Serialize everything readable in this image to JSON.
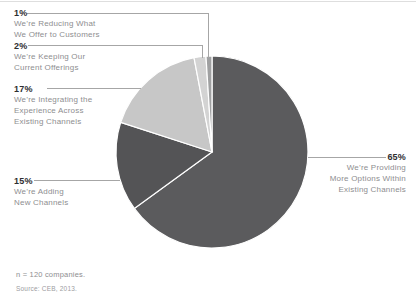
{
  "chart_data": {
    "type": "pie",
    "unit": "%",
    "start_angle_deg": 0,
    "direction": "clockwise",
    "slices": [
      {
        "label": "We’re Providing More Options Within Existing Channels",
        "pct": 65,
        "color": "#5b5b5d"
      },
      {
        "label": "We’re Adding New Channels",
        "pct": 15,
        "color": "#545456"
      },
      {
        "label": "We’re Integrating the Experience Across Existing Channels",
        "pct": 17,
        "color": "#c7c7c7"
      },
      {
        "label": "We’re Keeping Our Current Offerings",
        "pct": 2,
        "color": "#d3d3d3"
      },
      {
        "label": "We’re Reducing What We Offer to Customers",
        "pct": 1,
        "color": "#9fa0a1"
      }
    ],
    "note": "n = 120 companies.",
    "source": "Source: CEB, 2013.",
    "legend_position": "callouts",
    "divider_color": "#ffffff"
  },
  "callouts": [
    {
      "pct": "1%",
      "line1": "We’re Reducing What",
      "line2": "We Offer to Customers"
    },
    {
      "pct": "2%",
      "line1": "We’re Keeping Our",
      "line2": "Current Offerings"
    },
    {
      "pct": "17%",
      "line1": "We’re Integrating the",
      "line2": "Experience Across",
      "line3": "Existing Channels"
    },
    {
      "pct": "15%",
      "line1": "We’re Adding",
      "line2": "New Channels"
    },
    {
      "pct": "65%",
      "line1": "We’re Providing",
      "line2": "More Options Within",
      "line3": "Existing Channels"
    }
  ],
  "footer": {
    "note": "n = 120 companies.",
    "source": "Source: CEB, 2013."
  }
}
